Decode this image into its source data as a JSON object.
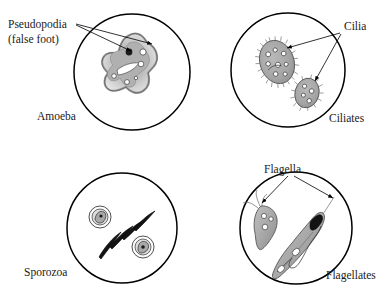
{
  "figure": {
    "background_color": "#ffffff",
    "ink_color": "#000000"
  },
  "panels": [
    {
      "id": "amoeba",
      "name_label": "Amoeba",
      "callout_line1": "Pseudopodia",
      "callout_line2": "(false foot)",
      "organism": "amoeba",
      "arrow_count": 2,
      "features": "irregular blob with pseudopodia, dark nucleus, contractile vacuoles"
    },
    {
      "id": "ciliates",
      "name_label": "Ciliates",
      "callout_line1": "Cilia",
      "callout_line2": "",
      "organism": "ciliate",
      "arrow_count": 2,
      "features": "two oval cells fringed with short cilia, internal vacuoles"
    },
    {
      "id": "sporozoa",
      "name_label": "Sporozoa",
      "callout_line1": "",
      "callout_line2": "",
      "organism": "sporozoan",
      "arrow_count": 0,
      "features": "crescent sporozoites and two encysted round cells"
    },
    {
      "id": "flagellates",
      "name_label": "Flagellates",
      "callout_line1": "Flagella",
      "callout_line2": "",
      "organism": "flagellate",
      "arrow_count": 2,
      "features": "pear-shaped cell with whip flagella and elongated trypanosome with undulating membrane"
    }
  ],
  "colors": {
    "outline": "#000000",
    "cell_fill_light": "#d8d8d8",
    "cell_fill_mid": "#b5b5b5",
    "cell_fill_dark": "#8e8e8e",
    "nucleus": "#1b1b1b",
    "vacuole": "#ffffff",
    "text": "#1a1a1a"
  }
}
